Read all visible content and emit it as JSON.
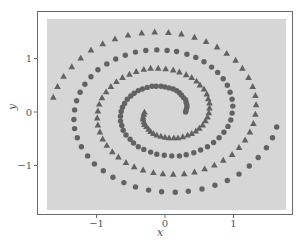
{
  "chart_data": {
    "type": "scatter",
    "title": "",
    "xlabel": "x",
    "ylabel": "y",
    "xlim": [
      -1.88,
      1.88
    ],
    "ylim": [
      -1.92,
      1.88
    ],
    "xticks": [
      -1,
      0,
      1
    ],
    "xtick_labels": [
      "−1",
      "0",
      "1"
    ],
    "yticks": [
      -1,
      0,
      1
    ],
    "ytick_labels": [
      "−1",
      "0",
      "1"
    ],
    "grid": false,
    "legend": null,
    "background_color": "#d6d6d6",
    "marker_color": "#626262",
    "series": [
      {
        "name": "spiral-circles",
        "marker": "circle",
        "points": [
          [
            0.3,
            0.0
          ],
          [
            0.31,
            0.04
          ],
          [
            0.32,
            0.09
          ],
          [
            0.32,
            0.13
          ],
          [
            0.31,
            0.18
          ],
          [
            0.3,
            0.23
          ],
          [
            0.27,
            0.27
          ],
          [
            0.24,
            0.32
          ],
          [
            0.21,
            0.36
          ],
          [
            0.17,
            0.4
          ],
          [
            0.12,
            0.43
          ],
          [
            0.06,
            0.45
          ],
          [
            0.0,
            0.47
          ],
          [
            -0.06,
            0.48
          ],
          [
            -0.13,
            0.48
          ],
          [
            -0.19,
            0.48
          ],
          [
            -0.26,
            0.46
          ],
          [
            -0.33,
            0.43
          ],
          [
            -0.39,
            0.4
          ],
          [
            -0.45,
            0.35
          ],
          [
            -0.5,
            0.3
          ],
          [
            -0.55,
            0.24
          ],
          [
            -0.59,
            0.16
          ],
          [
            -0.62,
            0.09
          ],
          [
            -0.64,
            0.01
          ],
          [
            -0.65,
            -0.08
          ],
          [
            -0.65,
            -0.17
          ],
          [
            -0.63,
            -0.25
          ],
          [
            -0.61,
            -0.34
          ],
          [
            -0.57,
            -0.43
          ],
          [
            -0.51,
            -0.51
          ],
          [
            -0.46,
            -0.58
          ],
          [
            -0.39,
            -0.65
          ],
          [
            -0.31,
            -0.7
          ],
          [
            -0.21,
            -0.75
          ],
          [
            -0.12,
            -0.79
          ],
          [
            -0.01,
            -0.81
          ],
          [
            0.1,
            -0.82
          ],
          [
            0.21,
            -0.82
          ],
          [
            0.31,
            -0.8
          ],
          [
            0.42,
            -0.76
          ],
          [
            0.52,
            -0.71
          ],
          [
            0.62,
            -0.65
          ],
          [
            0.71,
            -0.57
          ],
          [
            0.79,
            -0.48
          ],
          [
            0.86,
            -0.38
          ],
          [
            0.92,
            -0.27
          ],
          [
            0.96,
            -0.15
          ],
          [
            0.98,
            -0.02
          ],
          [
            0.99,
            0.11
          ],
          [
            0.98,
            0.24
          ],
          [
            0.95,
            0.37
          ],
          [
            0.91,
            0.5
          ],
          [
            0.85,
            0.62
          ],
          [
            0.77,
            0.74
          ],
          [
            0.68,
            0.84
          ],
          [
            0.57,
            0.94
          ],
          [
            0.45,
            1.02
          ],
          [
            0.32,
            1.08
          ],
          [
            0.17,
            1.13
          ],
          [
            0.03,
            1.15
          ],
          [
            -0.12,
            1.16
          ],
          [
            -0.28,
            1.15
          ],
          [
            -0.43,
            1.12
          ],
          [
            -0.58,
            1.06
          ],
          [
            -0.72,
            0.99
          ],
          [
            -0.85,
            0.9
          ],
          [
            -0.98,
            0.79
          ],
          [
            -1.08,
            0.66
          ],
          [
            -1.17,
            0.52
          ],
          [
            -1.24,
            0.37
          ],
          [
            -1.29,
            0.21
          ],
          [
            -1.32,
            0.04
          ],
          [
            -1.33,
            -0.14
          ],
          [
            -1.32,
            -0.31
          ],
          [
            -1.28,
            -0.48
          ],
          [
            -1.22,
            -0.65
          ],
          [
            -1.13,
            -0.82
          ],
          [
            -1.03,
            -0.97
          ],
          [
            -0.9,
            -1.1
          ],
          [
            -0.76,
            -1.22
          ],
          [
            -0.6,
            -1.32
          ],
          [
            -0.43,
            -1.4
          ],
          [
            -0.24,
            -1.46
          ],
          [
            -0.05,
            -1.49
          ],
          [
            0.15,
            -1.5
          ],
          [
            0.34,
            -1.48
          ],
          [
            0.54,
            -1.44
          ],
          [
            0.73,
            -1.37
          ],
          [
            0.91,
            -1.28
          ],
          [
            1.08,
            -1.16
          ],
          [
            1.23,
            -1.01
          ],
          [
            1.36,
            -0.85
          ],
          [
            1.48,
            -0.67
          ],
          [
            1.57,
            -0.48
          ],
          [
            1.63,
            -0.28
          ]
        ]
      },
      {
        "name": "spiral-triangles",
        "marker": "triangle",
        "points": [
          [
            -0.3,
            0.0
          ],
          [
            -0.31,
            -0.04
          ],
          [
            -0.32,
            -0.09
          ],
          [
            -0.32,
            -0.13
          ],
          [
            -0.31,
            -0.18
          ],
          [
            -0.3,
            -0.23
          ],
          [
            -0.27,
            -0.27
          ],
          [
            -0.24,
            -0.32
          ],
          [
            -0.21,
            -0.36
          ],
          [
            -0.17,
            -0.4
          ],
          [
            -0.12,
            -0.43
          ],
          [
            -0.06,
            -0.45
          ],
          [
            0.0,
            -0.47
          ],
          [
            0.06,
            -0.48
          ],
          [
            0.13,
            -0.48
          ],
          [
            0.19,
            -0.48
          ],
          [
            0.26,
            -0.46
          ],
          [
            0.33,
            -0.43
          ],
          [
            0.39,
            -0.4
          ],
          [
            0.45,
            -0.35
          ],
          [
            0.5,
            -0.3
          ],
          [
            0.55,
            -0.24
          ],
          [
            0.59,
            -0.16
          ],
          [
            0.62,
            -0.09
          ],
          [
            0.64,
            -0.01
          ],
          [
            0.65,
            0.08
          ],
          [
            0.65,
            0.17
          ],
          [
            0.63,
            0.25
          ],
          [
            0.61,
            0.34
          ],
          [
            0.57,
            0.43
          ],
          [
            0.51,
            0.51
          ],
          [
            0.46,
            0.58
          ],
          [
            0.39,
            0.65
          ],
          [
            0.31,
            0.7
          ],
          [
            0.21,
            0.75
          ],
          [
            0.12,
            0.79
          ],
          [
            0.01,
            0.81
          ],
          [
            -0.1,
            0.82
          ],
          [
            -0.21,
            0.82
          ],
          [
            -0.31,
            0.8
          ],
          [
            -0.42,
            0.76
          ],
          [
            -0.52,
            0.71
          ],
          [
            -0.62,
            0.65
          ],
          [
            -0.71,
            0.57
          ],
          [
            -0.79,
            0.48
          ],
          [
            -0.86,
            0.38
          ],
          [
            -0.92,
            0.27
          ],
          [
            -0.96,
            0.15
          ],
          [
            -0.98,
            0.02
          ],
          [
            -0.99,
            -0.11
          ],
          [
            -0.98,
            -0.24
          ],
          [
            -0.95,
            -0.37
          ],
          [
            -0.91,
            -0.5
          ],
          [
            -0.85,
            -0.62
          ],
          [
            -0.77,
            -0.74
          ],
          [
            -0.68,
            -0.84
          ],
          [
            -0.57,
            -0.94
          ],
          [
            -0.45,
            -1.02
          ],
          [
            -0.32,
            -1.08
          ],
          [
            -0.17,
            -1.13
          ],
          [
            -0.03,
            -1.15
          ],
          [
            0.12,
            -1.16
          ],
          [
            0.28,
            -1.15
          ],
          [
            0.43,
            -1.12
          ],
          [
            0.58,
            -1.06
          ],
          [
            0.72,
            -0.99
          ],
          [
            0.85,
            -0.9
          ],
          [
            0.98,
            -0.79
          ],
          [
            1.08,
            -0.66
          ],
          [
            1.17,
            -0.52
          ],
          [
            1.24,
            -0.37
          ],
          [
            1.29,
            -0.21
          ],
          [
            1.32,
            -0.04
          ],
          [
            1.33,
            0.14
          ],
          [
            1.32,
            0.31
          ],
          [
            1.28,
            0.48
          ],
          [
            1.22,
            0.65
          ],
          [
            1.13,
            0.82
          ],
          [
            1.03,
            0.97
          ],
          [
            0.9,
            1.1
          ],
          [
            0.76,
            1.22
          ],
          [
            0.6,
            1.32
          ],
          [
            0.43,
            1.4
          ],
          [
            0.24,
            1.46
          ],
          [
            0.05,
            1.49
          ],
          [
            -0.15,
            1.5
          ],
          [
            -0.34,
            1.48
          ],
          [
            -0.54,
            1.44
          ],
          [
            -0.73,
            1.37
          ],
          [
            -0.91,
            1.28
          ],
          [
            -1.08,
            1.16
          ],
          [
            -1.23,
            1.01
          ],
          [
            -1.36,
            0.85
          ],
          [
            -1.48,
            0.67
          ],
          [
            -1.57,
            0.48
          ],
          [
            -1.63,
            0.28
          ]
        ]
      }
    ]
  }
}
